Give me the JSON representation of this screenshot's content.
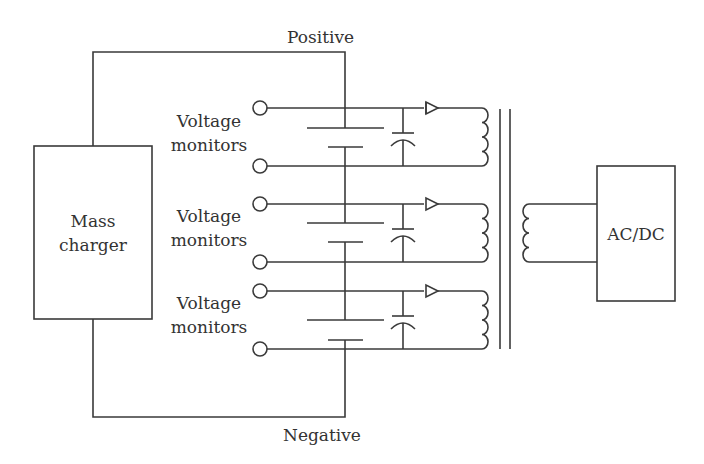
{
  "labels": {
    "positive": "Positive",
    "negative": "Negative",
    "mass_charger_line1": "Mass",
    "mass_charger_line2": "charger",
    "acdc": "AC/DC",
    "voltage_monitors": [
      {
        "line1": "Voltage",
        "line2": "monitors"
      },
      {
        "line1": "Voltage",
        "line2": "monitors"
      },
      {
        "line1": "Voltage",
        "line2": "monitors"
      }
    ]
  },
  "colors": {
    "line": "#3a3a3a",
    "text": "#333333",
    "background": "#ffffff"
  }
}
